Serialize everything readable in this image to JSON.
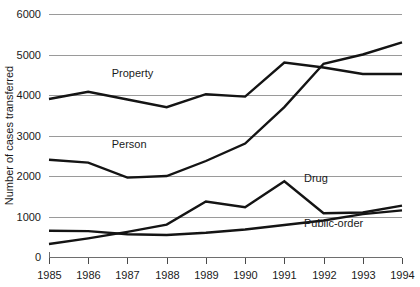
{
  "chart_data": {
    "type": "line",
    "title": "",
    "xlabel": "",
    "ylabel": "Number of cases transferred",
    "x": [
      1985,
      1986,
      1987,
      1988,
      1989,
      1990,
      1991,
      1992,
      1993,
      1994
    ],
    "xtick_labels": [
      "1985",
      "1986",
      "1987",
      "1988",
      "1989",
      "1990",
      "1991",
      "1992",
      "1993",
      "1994"
    ],
    "ytick_labels": [
      "0",
      "1000",
      "2000",
      "3000",
      "4000",
      "5000",
      "6000"
    ],
    "yticks": [
      0,
      1000,
      2000,
      3000,
      4000,
      5000,
      6000
    ],
    "ylim": [
      0,
      6000
    ],
    "xlim": [
      1985,
      1994
    ],
    "grid": "horizontal",
    "legend_position": "inline-labels",
    "series": [
      {
        "name": "Property",
        "label": "Property",
        "values": [
          3900,
          4080,
          3890,
          3700,
          4020,
          3960,
          4800,
          4680,
          4520,
          4520
        ],
        "color": "#141414"
      },
      {
        "name": "Person",
        "label": "Person",
        "values": [
          2400,
          2330,
          1960,
          2000,
          2370,
          2800,
          3700,
          4770,
          5000,
          5300
        ],
        "color": "#141414"
      },
      {
        "name": "Drug",
        "label": "Drug",
        "values": [
          320,
          460,
          620,
          800,
          1370,
          1230,
          1870,
          1080,
          1100,
          1270
        ],
        "color": "#141414"
      },
      {
        "name": "Public-order",
        "label": "Public-order",
        "values": [
          650,
          640,
          560,
          545,
          600,
          680,
          790,
          900,
          1060,
          1150
        ],
        "color": "#141414"
      }
    ],
    "series_label_positions": [
      {
        "name": "Property",
        "x": 1986.6,
        "y": 4450
      },
      {
        "name": "Person",
        "x": 1986.6,
        "y": 2700
      },
      {
        "name": "Drug",
        "x": 1991.5,
        "y": 1850
      },
      {
        "name": "Public-order",
        "x": 1991.5,
        "y": 730
      }
    ]
  }
}
